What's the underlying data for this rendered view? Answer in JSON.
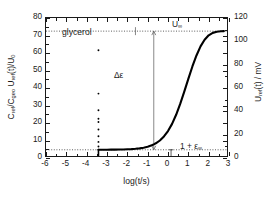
{
  "chart_data": {
    "type": "line",
    "title": "",
    "sample_label": "glycerol",
    "xlabel": "log(t/s)",
    "ylabel_left": "Cref/Cgeo Uref(t)/U0",
    "ylabel_right": "Uref(t) / mV",
    "xlim": [
      -6,
      3
    ],
    "ylim_left": [
      0,
      80
    ],
    "ylim_right": [
      0,
      120
    ],
    "grid": false,
    "legend": "none",
    "xticks": [
      -6,
      -5,
      -4,
      -3,
      -2,
      -1,
      0,
      1,
      2,
      3
    ],
    "xticklabels": [
      "-6",
      "-5",
      "-4",
      "-3",
      "-2",
      "-1",
      "0",
      "1",
      "2",
      "3"
    ],
    "yticks_left": [
      0,
      10,
      20,
      30,
      40,
      50,
      60,
      70,
      80
    ],
    "yticklabels_left": [
      "0",
      "10",
      "20",
      "30",
      "40",
      "50",
      "60",
      "70",
      "80"
    ],
    "yticks_right": [
      0,
      20,
      40,
      60,
      80,
      100,
      120
    ],
    "yticklabels_right": [
      "0",
      "20",
      "40",
      "60",
      "80",
      "100",
      "120"
    ],
    "annotations": [
      {
        "name": "sample",
        "text": "glycerol",
        "x": -4.9,
        "y": 73
      },
      {
        "name": "delta-epsilon",
        "text": "Δε",
        "x": -1.05,
        "y": 41
      },
      {
        "name": "u-infinity",
        "text": "U",
        "sub": "∞",
        "x": 0.85,
        "y": 78
      },
      {
        "name": "one-plus-epsilon-infinity",
        "text": "1 + ε",
        "sub": "∞",
        "x": 0.4,
        "y": 2.4
      }
    ],
    "reference_lines": [
      {
        "name": "baseline-zero",
        "orientation": "horizontal",
        "y": 0,
        "style": "dotted"
      },
      {
        "name": "epsilon-infinity-plateau",
        "orientation": "horizontal",
        "y": 4.7,
        "style": "dotted"
      },
      {
        "name": "u-infinity-plateau",
        "orientation": "horizontal",
        "y": 72.5,
        "style": "dotted"
      }
    ],
    "delta_epsilon_arrow": {
      "x": -0.7,
      "y_bottom": 4.7,
      "y_top": 72.5,
      "value": 67.8
    },
    "series": [
      {
        "name": "noise-baseline",
        "style": "scatter-dense",
        "points": [
          [
            -6.0,
            0.0
          ],
          [
            -5.9,
            -0.15
          ],
          [
            -5.8,
            0.2
          ],
          [
            -5.7,
            -0.1
          ],
          [
            -5.6,
            0.15
          ],
          [
            -5.5,
            -0.2
          ],
          [
            -5.4,
            0.1
          ],
          [
            -5.3,
            -0.15
          ],
          [
            -5.2,
            0.2
          ],
          [
            -5.1,
            -0.1
          ],
          [
            -5.0,
            0.15
          ],
          [
            -4.9,
            -0.2
          ],
          [
            -4.8,
            0.1
          ],
          [
            -4.7,
            -0.15
          ],
          [
            -4.6,
            0.2
          ],
          [
            -4.5,
            -0.1
          ],
          [
            -4.4,
            0.05
          ],
          [
            -4.3,
            -0.2
          ],
          [
            -4.2,
            0.1
          ],
          [
            -4.1,
            -0.1
          ],
          [
            -4.0,
            0.15
          ],
          [
            -3.9,
            -0.15
          ],
          [
            -3.8,
            0.1
          ],
          [
            -3.7,
            -0.1
          ],
          [
            -3.6,
            0.05
          ],
          [
            -3.5,
            -0.1
          ],
          [
            -3.45,
            0.0
          ]
        ]
      },
      {
        "name": "transient-spike",
        "style": "scatter-vertical",
        "x": -3.42,
        "y_values": [
          4.8,
          6.6,
          9.2,
          12.4,
          16.3,
          20.6,
          22.4,
          27.3,
          36.8,
          61.6
        ]
      },
      {
        "name": "relaxation-response",
        "style": "line",
        "points": [
          [
            -3.42,
            4.72
          ],
          [
            -3.2,
            4.73
          ],
          [
            -3.0,
            4.74
          ],
          [
            -2.8,
            4.76
          ],
          [
            -2.6,
            4.78
          ],
          [
            -2.4,
            4.82
          ],
          [
            -2.2,
            4.88
          ],
          [
            -2.0,
            4.96
          ],
          [
            -1.8,
            5.08
          ],
          [
            -1.6,
            5.26
          ],
          [
            -1.4,
            5.52
          ],
          [
            -1.2,
            5.9
          ],
          [
            -1.0,
            6.45
          ],
          [
            -0.8,
            7.25
          ],
          [
            -0.7,
            7.8
          ],
          [
            -0.6,
            8.4
          ],
          [
            -0.4,
            10.0
          ],
          [
            -0.2,
            12.3
          ],
          [
            0.0,
            15.4
          ],
          [
            0.2,
            19.5
          ],
          [
            0.4,
            24.7
          ],
          [
            0.6,
            30.9
          ],
          [
            0.8,
            37.9
          ],
          [
            1.0,
            45.2
          ],
          [
            1.2,
            52.3
          ],
          [
            1.4,
            58.6
          ],
          [
            1.6,
            63.8
          ],
          [
            1.8,
            67.6
          ],
          [
            2.0,
            70.1
          ],
          [
            2.2,
            71.5
          ],
          [
            2.4,
            72.1
          ],
          [
            2.6,
            72.4
          ],
          [
            2.75,
            72.5
          ]
        ]
      }
    ]
  }
}
